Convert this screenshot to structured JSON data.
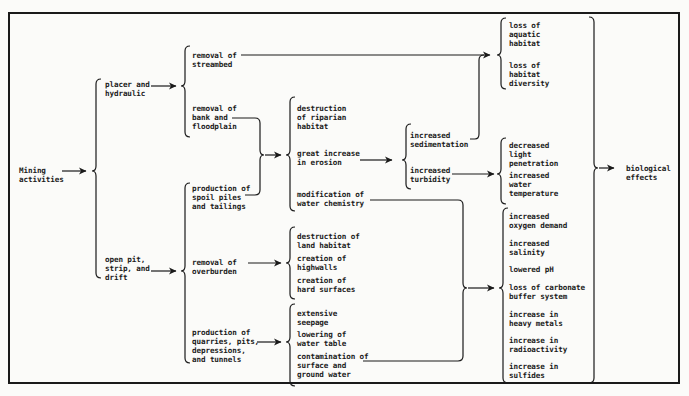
{
  "diagram": {
    "root": "Mining\nactivities",
    "methods": {
      "placer": "placer and\nhydraulic",
      "openpit": "open pit,\nstrip, and\ndrift"
    },
    "activities": {
      "streambed": "removal of\nstreambed",
      "bank": "removal of\nbank and\nfloodplain",
      "spoil": "production of\nspoil piles\nand tailings",
      "overburden": "removal of\noverburden",
      "quarries": "production of\nquarries, pits,\ndepressions,\nand tunnels"
    },
    "primary_effects": {
      "riparian": "destruction\nof riparian\nhabitat",
      "erosion": "great increase\nin erosion",
      "chemistry": "modification of\nwater chemistry",
      "land": "destruction of\nland habitat",
      "highwalls": "creation of\nhighwalls",
      "hard": "creation of\nhard surfaces",
      "seepage": "extensive\nseepage",
      "watertable": "lowering of\nwater table",
      "contamination": "contamination of\nsurface and\nground water"
    },
    "secondary_effects": {
      "sedimentation": "increased\nsedimentation",
      "turbidity": "increased\nturbidity"
    },
    "habitat_effects": {
      "aquatic": "loss of\naquatic\nhabitat",
      "diversity": "loss of\nhabitat\ndiversity"
    },
    "physical_effects": {
      "light": "decreased\nlight\npenetration",
      "temperature": "increased\nwater\ntemperature"
    },
    "chemical_effects": {
      "oxygen": "increased\noxygen demand",
      "salinity": "increased\nsalinity",
      "ph": "lowered pH",
      "carbonate": "loss of carbonate\nbuffer system",
      "metals": "increase in\nheavy metals",
      "radioactivity": "increase in\nradioactivity",
      "sulfides": "increase in\nsulfides"
    },
    "outcome": "biological\neffects"
  }
}
